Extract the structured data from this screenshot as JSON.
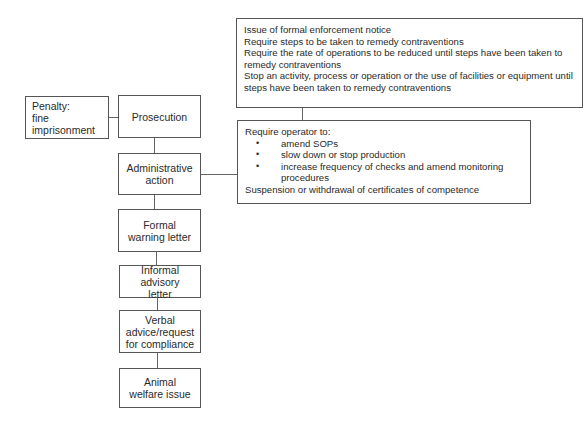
{
  "ladder": [
    {
      "id": "prosecution",
      "label": "Prosecution"
    },
    {
      "id": "administrative-action",
      "label": "Administrative action"
    },
    {
      "id": "formal-warning-letter",
      "label": "Formal warning letter"
    },
    {
      "id": "informal-advisory-letter",
      "label": "Informal advisory letter"
    },
    {
      "id": "verbal-advice",
      "label": "Verbal advice/request for compliance"
    },
    {
      "id": "animal-welfare-issue",
      "label": "Animal welfare issue"
    }
  ],
  "penalty": {
    "title": "Penalty:",
    "items": [
      "fine",
      "imprisonment"
    ]
  },
  "enforcement_box": {
    "lines": [
      "Issue of formal enforcement notice",
      "Require steps to be taken to remedy contraventions",
      "Require the rate of operations to be reduced until steps have been taken to remedy contraventions",
      "Stop an activity, process or operation or the use of facilities or equipment until steps have been taken to remedy contraventions"
    ]
  },
  "operator_box": {
    "intro": "Require operator to:",
    "bullets": [
      "amend SOPs",
      "slow down or stop production",
      "increase frequency of checks and amend monitoring procedures"
    ],
    "footer": "Suspension or withdrawal of certificates of competence"
  }
}
